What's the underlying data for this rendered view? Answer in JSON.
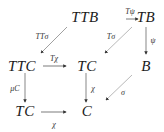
{
  "diagram": {
    "type": "commutative-diagram",
    "nodes": [
      {
        "id": "TTB",
        "label": "TTB",
        "x": 111,
        "y": 11
      },
      {
        "id": "TB",
        "label": "TB",
        "x": 151,
        "y": 11
      },
      {
        "id": "TTC",
        "label": "TTC",
        "x": 42,
        "y": 61
      },
      {
        "id": "TC1",
        "label": "TC",
        "x": 91,
        "y": 61
      },
      {
        "id": "B",
        "label": "B",
        "x": 148,
        "y": 61
      },
      {
        "id": "TC2",
        "label": "TC",
        "x": 42,
        "y": 110
      },
      {
        "id": "C",
        "label": "C",
        "x": 91,
        "y": 110
      }
    ],
    "edges": [
      {
        "from": "TTB",
        "to": "TB",
        "label": "Tψ"
      },
      {
        "from": "TTB",
        "to": "TTC",
        "label": "TTσ"
      },
      {
        "from": "TB",
        "to": "TC1",
        "label": "Tσ"
      },
      {
        "from": "TB",
        "to": "B",
        "label": "ψ"
      },
      {
        "from": "TTC",
        "to": "TC1",
        "label": "Tχ"
      },
      {
        "from": "TTC",
        "to": "TC2",
        "label": "μC"
      },
      {
        "from": "TC1",
        "to": "C",
        "label": "χ"
      },
      {
        "from": "B",
        "to": "C",
        "label": "σ"
      },
      {
        "from": "TC2",
        "to": "C",
        "label": "χ"
      }
    ]
  }
}
